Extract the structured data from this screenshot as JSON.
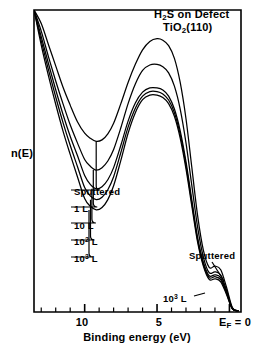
{
  "figure": {
    "title_line1": "H2S on Defect",
    "title_line2": "TiO2(110)",
    "y_axis_label": "n(E)",
    "x_axis_label": "Binding energy (eV)",
    "x_ticks": [
      "10",
      "5",
      "EF = 0"
    ],
    "annotation_right": "Sputtered",
    "annotation_bottom": "10^3 L",
    "legend": [
      "Sputtered",
      "1 L",
      "10 L",
      "10^2 L",
      "10^3 L"
    ],
    "line_color": "#000000",
    "background_color": "#ffffff"
  },
  "chart_data": {
    "type": "line",
    "xlabel": "Binding energy (eV)",
    "ylabel": "n(E)",
    "xlim": [
      13.5,
      -0.8
    ],
    "x_axis_reversed": true,
    "ylim": [
      0,
      1
    ],
    "grid": false,
    "legend_position": "inside-left-leader-lines",
    "x_tick_values": [
      10,
      5,
      0
    ],
    "x_tick_labels": [
      "10",
      "5",
      "EF = 0"
    ],
    "x_minor_tick_interval": 1,
    "y_ticks_shown": false,
    "annotations": [
      {
        "text": "Sputtered",
        "points_to_series": "Sputtered",
        "near_x": 1.2,
        "region": "fermi-edge-peak"
      },
      {
        "text": "10^3 L",
        "points_to_series": "10^3 L",
        "near_x": 2.6,
        "region": "fermi-edge-peak"
      }
    ],
    "series": [
      {
        "name": "Sputtered",
        "main_peak_x": 3.6,
        "main_peak_height": 0.905,
        "valley_x": 9.2,
        "valley_height": 0.565,
        "fermi_peak_x": 1.2,
        "fermi_peak_height": 0.15,
        "x": [
          13.5,
          13.0,
          12.5,
          12.0,
          11.5,
          11.0,
          10.5,
          10.0,
          9.6,
          9.2,
          8.8,
          8.4,
          8.0,
          7.5,
          7.0,
          6.5,
          6.0,
          5.5,
          5.0,
          4.6,
          4.2,
          3.8,
          3.4,
          3.0,
          2.6,
          2.2,
          1.8,
          1.4,
          1.0,
          0.6,
          0.2,
          -0.2,
          -0.6
        ],
        "y": [
          1.0,
          0.955,
          0.885,
          0.815,
          0.745,
          0.685,
          0.63,
          0.592,
          0.575,
          0.565,
          0.57,
          0.59,
          0.625,
          0.69,
          0.76,
          0.82,
          0.868,
          0.896,
          0.905,
          0.9,
          0.882,
          0.84,
          0.76,
          0.64,
          0.48,
          0.32,
          0.205,
          0.148,
          0.152,
          0.14,
          0.082,
          0.015,
          0.004
        ]
      },
      {
        "name": "1 L",
        "main_peak_x": 3.6,
        "main_peak_height": 0.82,
        "valley_x": 9.4,
        "valley_height": 0.47,
        "fermi_peak_x": 1.2,
        "fermi_peak_height": 0.128,
        "x": [
          13.5,
          13.0,
          12.5,
          12.0,
          11.5,
          11.0,
          10.5,
          10.0,
          9.6,
          9.2,
          8.8,
          8.4,
          8.0,
          7.5,
          7.0,
          6.5,
          6.0,
          5.5,
          5.0,
          4.6,
          4.2,
          3.8,
          3.4,
          3.0,
          2.6,
          2.2,
          1.8,
          1.4,
          1.0,
          0.6,
          0.2,
          -0.2,
          -0.6
        ],
        "y": [
          1.0,
          0.93,
          0.845,
          0.765,
          0.69,
          0.62,
          0.56,
          0.505,
          0.482,
          0.47,
          0.478,
          0.5,
          0.538,
          0.61,
          0.69,
          0.755,
          0.8,
          0.818,
          0.82,
          0.812,
          0.792,
          0.748,
          0.672,
          0.56,
          0.42,
          0.282,
          0.182,
          0.13,
          0.133,
          0.122,
          0.072,
          0.013,
          0.004
        ]
      },
      {
        "name": "10 L",
        "main_peak_x": 3.6,
        "main_peak_height": 0.742,
        "valley_x": 9.5,
        "valley_height": 0.408,
        "fermi_peak_x": 1.2,
        "fermi_peak_height": 0.118,
        "x": [
          13.5,
          13.0,
          12.5,
          12.0,
          11.5,
          11.0,
          10.5,
          10.0,
          9.6,
          9.2,
          8.8,
          8.4,
          8.0,
          7.5,
          7.0,
          6.5,
          6.0,
          5.5,
          5.0,
          4.6,
          4.2,
          3.8,
          3.4,
          3.0,
          2.6,
          2.2,
          1.8,
          1.4,
          1.0,
          0.6,
          0.2,
          -0.2,
          -0.6
        ],
        "y": [
          1.0,
          0.912,
          0.822,
          0.736,
          0.655,
          0.582,
          0.518,
          0.452,
          0.422,
          0.408,
          0.415,
          0.438,
          0.478,
          0.552,
          0.632,
          0.692,
          0.728,
          0.742,
          0.742,
          0.735,
          0.715,
          0.672,
          0.6,
          0.498,
          0.372,
          0.248,
          0.165,
          0.12,
          0.123,
          0.113,
          0.066,
          0.012,
          0.004
        ]
      },
      {
        "name": "10^2 L",
        "main_peak_x": 3.6,
        "main_peak_height": 0.73,
        "valley_x": 9.6,
        "valley_height": 0.372,
        "fermi_peak_x": 1.2,
        "fermi_peak_height": 0.112,
        "x": [
          13.5,
          13.0,
          12.5,
          12.0,
          11.5,
          11.0,
          10.5,
          10.0,
          9.6,
          9.2,
          8.8,
          8.4,
          8.0,
          7.5,
          7.0,
          6.5,
          6.0,
          5.5,
          5.0,
          4.6,
          4.2,
          3.8,
          3.4,
          3.0,
          2.6,
          2.2,
          1.8,
          1.4,
          1.0,
          0.6,
          0.2,
          -0.2,
          -0.6
        ],
        "y": [
          1.0,
          0.898,
          0.802,
          0.712,
          0.628,
          0.552,
          0.482,
          0.412,
          0.384,
          0.372,
          0.38,
          0.405,
          0.448,
          0.528,
          0.612,
          0.675,
          0.715,
          0.73,
          0.73,
          0.722,
          0.702,
          0.66,
          0.588,
          0.486,
          0.362,
          0.24,
          0.158,
          0.114,
          0.117,
          0.107,
          0.062,
          0.011,
          0.004
        ]
      },
      {
        "name": "10^3 L",
        "main_peak_x": 3.6,
        "main_peak_height": 0.718,
        "valley_x": 9.7,
        "valley_height": 0.338,
        "fermi_peak_x": 1.2,
        "fermi_peak_height": 0.104,
        "x": [
          13.5,
          13.0,
          12.5,
          12.0,
          11.5,
          11.0,
          10.5,
          10.0,
          9.6,
          9.2,
          8.8,
          8.4,
          8.0,
          7.5,
          7.0,
          6.5,
          6.0,
          5.5,
          5.0,
          4.6,
          4.2,
          3.8,
          3.4,
          3.0,
          2.6,
          2.2,
          1.8,
          1.4,
          1.0,
          0.6,
          0.2,
          -0.2,
          -0.6
        ],
        "y": [
          1.0,
          0.884,
          0.782,
          0.688,
          0.6,
          0.522,
          0.448,
          0.376,
          0.35,
          0.338,
          0.346,
          0.372,
          0.418,
          0.502,
          0.592,
          0.66,
          0.703,
          0.718,
          0.718,
          0.71,
          0.69,
          0.648,
          0.576,
          0.474,
          0.352,
          0.232,
          0.152,
          0.108,
          0.11,
          0.1,
          0.058,
          0.01,
          0.004
        ]
      }
    ]
  }
}
